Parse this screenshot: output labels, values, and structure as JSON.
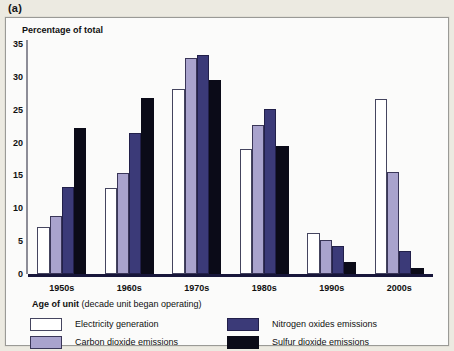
{
  "figure_label": "(a)",
  "chart_data": {
    "type": "bar",
    "title": "",
    "ylabel": "Percentage of total",
    "xlabel_bold": "Age of unit",
    "xlabel_rest": " (decade unit began operating)",
    "categories": [
      "1950s",
      "1960s",
      "1970s",
      "1980s",
      "1990s",
      "2000s"
    ],
    "yticks": [
      0,
      5,
      10,
      15,
      20,
      25,
      30,
      35
    ],
    "ylim": [
      0,
      35
    ],
    "grid": false,
    "legend_position": "bottom",
    "series": [
      {
        "name": "Electricity generation",
        "color": "#ffffff",
        "values": [
          7.2,
          13.1,
          28.1,
          19.0,
          6.2,
          26.7
        ]
      },
      {
        "name": "Carbon dioxide emissions",
        "color": "#a9a3cd",
        "values": [
          8.9,
          15.4,
          32.9,
          22.7,
          5.2,
          15.5
        ]
      },
      {
        "name": "Nitrogen oxides emissions",
        "color": "#3b3a78",
        "values": [
          13.2,
          21.4,
          33.4,
          25.1,
          4.3,
          3.5
        ]
      },
      {
        "name": "Sulfur dioxide emissions",
        "color": "#0b0b18",
        "values": [
          22.2,
          26.8,
          29.5,
          19.5,
          1.8,
          0.9
        ]
      }
    ]
  }
}
